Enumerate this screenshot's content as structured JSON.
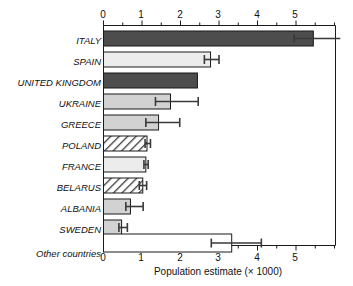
{
  "chart_data": {
    "type": "bar",
    "orientation": "horizontal",
    "title": "",
    "xlabel": "Population estimate (× 1000)",
    "ylabel": "",
    "xlim": [
      0,
      5.8
    ],
    "xticks": [
      0,
      1,
      2,
      3,
      4,
      5
    ],
    "xtick_labels": [
      "0",
      "1",
      "2",
      "3",
      "4",
      "5"
    ],
    "minor_tick_step": 0.5,
    "grid": false,
    "axis_top": true,
    "axis_bottom": true,
    "legend": "none",
    "categories": [
      "ITALY",
      "SPAIN",
      "UNITED KINGDOM",
      "UKRAINE",
      "GREECE",
      "POLAND",
      "FRANCE",
      "BELARUS",
      "ALBANIA",
      "SWEDEN",
      "Other countries"
    ],
    "values": [
      5.45,
      2.78,
      2.44,
      1.74,
      1.43,
      1.13,
      1.1,
      1.02,
      0.7,
      0.47,
      3.33
    ],
    "err_low": [
      4.95,
      2.62,
      null,
      1.35,
      1.1,
      1.08,
      1.05,
      0.93,
      0.58,
      0.4,
      2.8
    ],
    "err_high": [
      6.15,
      3.0,
      null,
      2.46,
      1.98,
      1.22,
      1.16,
      1.12,
      1.03,
      0.62,
      4.1
    ],
    "fills": [
      "dark-gray",
      "very-light-gray",
      "dark-gray",
      "light-gray",
      "light-gray",
      "hatched",
      "very-light-gray",
      "hatched",
      "light-gray",
      "light-gray",
      "white"
    ]
  },
  "colors": {
    "dark_gray": "#4d4d4d",
    "light_gray": "#d2d2d2",
    "very_light_gray": "#ececec",
    "white": "#ffffff",
    "hatch_line": "#3a3a3a",
    "axis": "#1a1a1a",
    "error_bar": "#3a3a3a",
    "text": "#111111"
  }
}
